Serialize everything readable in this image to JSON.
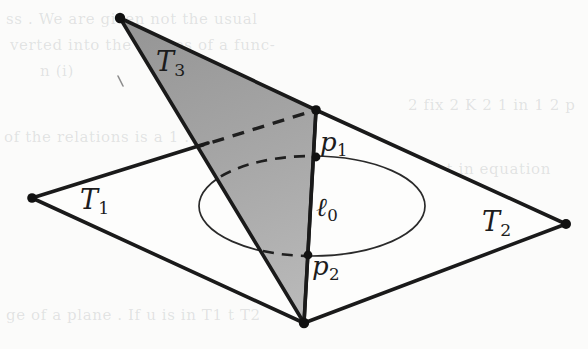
{
  "figure": {
    "caption_absent": true,
    "background_color": "#fbfbfa",
    "ink_color": "#1c1c1c",
    "shade_color_top": "#9b9b9b",
    "shade_color_bottom": "#b4b4b4"
  },
  "labels": {
    "t1": {
      "base": "T",
      "sub": "1"
    },
    "t2": {
      "base": "T",
      "sub": "2"
    },
    "t3": {
      "base": "T",
      "sub": "3"
    },
    "p1": {
      "base": "p",
      "sub": "1"
    },
    "p2": {
      "base": "p",
      "sub": "2"
    },
    "l0": {
      "base": "ℓ",
      "sub": "0"
    }
  },
  "bleed_text": {
    "line1": "ss  . We are given not the usual",
    "line2": "verted into the ranges of a func-",
    "line3": "n (i)",
    "line4": "2  fix  2  K 2  1  in  1  2  p",
    "line5": "of  the  relations  is  a  1  . 1  sel",
    "line6": "ment  in  equation",
    "line7": "ge of a plane . If  u  is in  T1  t  T2"
  },
  "geometry": {
    "plane_quad": [
      {
        "name": "left-vertex",
        "x": 32,
        "y": 198
      },
      {
        "name": "top-vertex",
        "x": 316,
        "y": 110
      },
      {
        "name": "right-vertex",
        "x": 566,
        "y": 224
      },
      {
        "name": "bottom-vertex",
        "x": 304,
        "y": 323
      }
    ],
    "triangle_t3": [
      {
        "name": "apex",
        "x": 120,
        "y": 18
      },
      {
        "name": "right-corner",
        "x": 316,
        "y": 110
      },
      {
        "name": "bottom-corner",
        "x": 304,
        "y": 323
      }
    ],
    "ellipse": {
      "cx": 312,
      "cy": 206,
      "rx": 113,
      "ry": 50
    },
    "line_l0": {
      "x1": 316,
      "y1": 110,
      "x2": 304,
      "y2": 323
    },
    "point_p1": {
      "x": 316,
      "y": 157
    },
    "point_p2": {
      "x": 308,
      "y": 255
    },
    "label_positions": {
      "t1": {
        "x": 80,
        "y": 186
      },
      "t2": {
        "x": 482,
        "y": 208
      },
      "t3": {
        "x": 156,
        "y": 48
      },
      "p1": {
        "x": 320,
        "y": 129
      },
      "p2": {
        "x": 312,
        "y": 253
      },
      "l0": {
        "x": 316,
        "y": 194
      }
    }
  }
}
